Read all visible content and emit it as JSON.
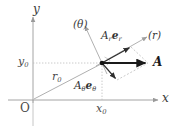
{
  "figure": {
    "type": "vector-decomposition-diagram",
    "background_color": "#ffffff",
    "axes": {
      "x_axis_label": "x",
      "y_axis_label": "y",
      "origin_label": "O",
      "axis_color": "#9a9a9a"
    },
    "ticks": {
      "x0_label": "x",
      "x0_sub": "0",
      "y0_label": "y",
      "y0_sub": "0"
    },
    "labels": {
      "r0": {
        "main": "r",
        "sub": "0"
      },
      "theta_direction": "(θ)",
      "r_direction": "(r)",
      "radial_component": {
        "coef": "A",
        "coef_sub": "r",
        "basis": "e",
        "basis_sub": "r"
      },
      "angular_component": {
        "coef": "A",
        "coef_sub": "θ",
        "basis": "e",
        "basis_sub": "θ"
      },
      "vector_A": "A"
    },
    "colors": {
      "vector_black": "#1a1a1a",
      "guide_gray": "#a8a8a8",
      "dashed_gray": "#b5b5b5",
      "axis_gray": "#9a9a9a",
      "component_arrow": "#2e2e2e"
    },
    "geometry": {
      "origin": {
        "x": 33,
        "y": 100
      },
      "point": {
        "x": 102,
        "y": 63
      },
      "x0_tick": {
        "x": 102,
        "y": 100
      },
      "y0_tick": {
        "x": 33,
        "y": 63
      },
      "A_tip": {
        "x": 148,
        "y": 63
      },
      "r_dir_tip": {
        "x": 146,
        "y": 36
      },
      "theta_dir_tip": {
        "x": 84,
        "y": 24
      },
      "Ar_er_tip": {
        "x": 131,
        "y": 47
      },
      "Atheta_etheta_tip": {
        "x": 117,
        "y": 80
      }
    }
  }
}
